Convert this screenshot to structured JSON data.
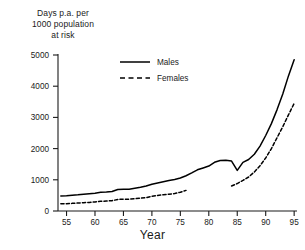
{
  "chart_data": {
    "type": "line",
    "title": "",
    "ylabel": "Days p.a. per 1000 population at risk",
    "ylabel_lines": [
      "Days p.a. per",
      "1000 population",
      "at risk"
    ],
    "xlabel": "Year",
    "xlim": [
      53.5,
      95.5
    ],
    "ylim": [
      0,
      5000
    ],
    "grid": false,
    "legend_position": "upper-left-inside",
    "xticks": [
      55,
      60,
      65,
      70,
      75,
      80,
      85,
      90,
      95
    ],
    "xtick_labels": [
      "55",
      "60",
      "65",
      "70",
      "75",
      "80",
      "85",
      "90",
      "95"
    ],
    "yticks": [
      0,
      1000,
      2000,
      3000,
      4000,
      5000
    ],
    "ytick_labels": [
      "0",
      "1000",
      "2000",
      "3000",
      "4000",
      "5000"
    ],
    "series": [
      {
        "name": "Males",
        "style": "solid",
        "color": "#000000",
        "x": [
          54,
          55,
          56,
          57,
          58,
          59,
          60,
          61,
          62,
          63,
          64,
          65,
          66,
          67,
          68,
          69,
          70,
          71,
          72,
          73,
          74,
          75,
          76,
          77,
          78,
          79,
          80,
          81,
          82,
          83,
          84,
          85,
          86,
          87,
          88,
          89,
          90,
          91,
          92,
          93,
          94,
          95
        ],
        "values": [
          480,
          490,
          505,
          520,
          540,
          555,
          570,
          600,
          610,
          625,
          690,
          700,
          700,
          730,
          760,
          800,
          860,
          900,
          940,
          980,
          1010,
          1060,
          1130,
          1220,
          1320,
          1380,
          1440,
          1560,
          1620,
          1630,
          1600,
          1300,
          1560,
          1650,
          1820,
          2080,
          2420,
          2800,
          3250,
          3750,
          4330,
          4850
        ]
      },
      {
        "name": "Females",
        "style": "dashed",
        "color": "#000000",
        "x": [
          54,
          55,
          56,
          57,
          58,
          59,
          60,
          61,
          62,
          63,
          64,
          65,
          66,
          67,
          68,
          69,
          70,
          71,
          72,
          73,
          74,
          75,
          76
        ],
        "values": [
          230,
          235,
          245,
          255,
          265,
          275,
          290,
          310,
          320,
          330,
          370,
          380,
          380,
          395,
          410,
          430,
          470,
          500,
          520,
          540,
          560,
          600,
          660
        ],
        "segment2_x": [
          84,
          85,
          86,
          87,
          88,
          89,
          90,
          91,
          92,
          93,
          94,
          95
        ],
        "segment2_values": [
          800,
          880,
          980,
          1090,
          1250,
          1450,
          1700,
          2000,
          2350,
          2700,
          3080,
          3450
        ]
      }
    ]
  },
  "legend": {
    "items": [
      {
        "label": "Males",
        "style": "solid"
      },
      {
        "label": "Females",
        "style": "dashed"
      }
    ]
  }
}
